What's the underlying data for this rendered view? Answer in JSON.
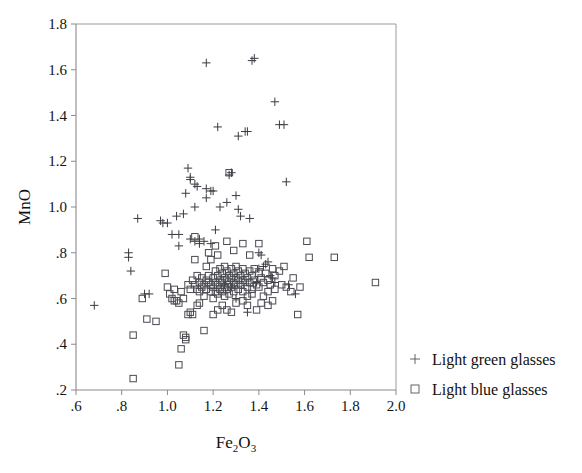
{
  "chart_data": {
    "type": "scatter",
    "title": "",
    "xlabel": "Fe2O3",
    "xlabel_display": "Fe",
    "xlabel_sub1": "2",
    "xlabel_mid": "O",
    "xlabel_sub2": "3",
    "ylabel": "MnO",
    "xlim": [
      0.6,
      2.0
    ],
    "ylim": [
      0.2,
      1.8
    ],
    "xticks": [
      0.6,
      0.8,
      1.0,
      1.2,
      1.4,
      1.6,
      1.8,
      2.0
    ],
    "xticklabels": [
      ".6",
      ".8",
      "1.0",
      "1.2",
      "1.4",
      "1.6",
      "1.8",
      "2.0"
    ],
    "yticks": [
      0.2,
      0.4,
      0.6,
      0.8,
      1.0,
      1.2,
      1.4,
      1.6,
      1.8
    ],
    "yticklabels": [
      ".2",
      ".4",
      ".6",
      ".8",
      "1.0",
      "1.2",
      "1.4",
      "1.6",
      "1.8"
    ],
    "grid": false,
    "legend_position": "outside-right-bottom",
    "series": [
      {
        "name": "Light green glasses",
        "marker": "plus",
        "color": "#3a3a42",
        "points": [
          [
            0.68,
            0.57
          ],
          [
            0.83,
            0.78
          ],
          [
            0.83,
            0.8
          ],
          [
            0.84,
            0.72
          ],
          [
            0.9,
            0.62
          ],
          [
            0.92,
            0.62
          ],
          [
            0.87,
            0.95
          ],
          [
            0.97,
            0.94
          ],
          [
            0.98,
            0.93
          ],
          [
            1.0,
            0.93
          ],
          [
            1.02,
            0.88
          ],
          [
            1.04,
            0.96
          ],
          [
            1.05,
            0.88
          ],
          [
            1.05,
            0.83
          ],
          [
            1.07,
            0.97
          ],
          [
            1.08,
            1.06
          ],
          [
            1.1,
            1.13
          ],
          [
            1.1,
            1.12
          ],
          [
            1.12,
            1.1
          ],
          [
            1.13,
            1.09
          ],
          [
            1.12,
            1.0
          ],
          [
            1.1,
            0.86
          ],
          [
            1.12,
            0.85
          ],
          [
            1.14,
            0.86
          ],
          [
            1.09,
            1.17
          ],
          [
            1.14,
            0.84
          ],
          [
            1.16,
            0.85
          ],
          [
            1.17,
            1.04
          ],
          [
            1.17,
            1.08
          ],
          [
            1.19,
            1.07
          ],
          [
            1.2,
            1.07
          ],
          [
            1.21,
            0.9
          ],
          [
            1.17,
            1.63
          ],
          [
            1.19,
            0.84
          ],
          [
            1.22,
            1.35
          ],
          [
            1.23,
            1.0
          ],
          [
            1.26,
            1.02
          ],
          [
            1.28,
            1.15
          ],
          [
            1.27,
            1.14
          ],
          [
            1.31,
            1.31
          ],
          [
            1.3,
            1.05
          ],
          [
            1.31,
            0.99
          ],
          [
            1.32,
            0.96
          ],
          [
            1.34,
            1.33
          ],
          [
            1.35,
            1.33
          ],
          [
            1.37,
            1.64
          ],
          [
            1.38,
            1.65
          ],
          [
            1.36,
            0.95
          ],
          [
            1.4,
            0.8
          ],
          [
            1.41,
            0.79
          ],
          [
            1.43,
            0.75
          ],
          [
            1.44,
            0.76
          ],
          [
            1.45,
            0.7
          ],
          [
            1.46,
            0.69
          ],
          [
            1.47,
            1.46
          ],
          [
            1.47,
            0.67
          ],
          [
            1.49,
            1.36
          ],
          [
            1.51,
            1.36
          ],
          [
            1.52,
            1.11
          ],
          [
            1.53,
            0.66
          ],
          [
            1.3,
            0.6
          ],
          [
            1.35,
            0.54
          ],
          [
            1.56,
            0.62
          ],
          [
            1.4,
            0.73
          ],
          [
            1.42,
            0.74
          ],
          [
            1.39,
            0.67
          ],
          [
            1.25,
            0.66
          ],
          [
            1.28,
            0.65
          ]
        ]
      },
      {
        "name": "Light blue glasses",
        "marker": "square",
        "color": "#4a4a52",
        "points": [
          [
            0.85,
            0.25
          ],
          [
            0.85,
            0.44
          ],
          [
            0.89,
            0.6
          ],
          [
            0.91,
            0.51
          ],
          [
            0.95,
            0.5
          ],
          [
            0.99,
            0.71
          ],
          [
            1.0,
            0.65
          ],
          [
            1.01,
            0.62
          ],
          [
            1.02,
            0.6
          ],
          [
            1.03,
            0.64
          ],
          [
            1.03,
            0.59
          ],
          [
            1.04,
            0.59
          ],
          [
            1.05,
            0.58
          ],
          [
            1.06,
            0.63
          ],
          [
            1.07,
            0.6
          ],
          [
            1.05,
            0.31
          ],
          [
            1.06,
            0.38
          ],
          [
            1.07,
            0.44
          ],
          [
            1.08,
            0.42
          ],
          [
            1.08,
            0.43
          ],
          [
            1.09,
            0.53
          ],
          [
            1.1,
            0.54
          ],
          [
            1.11,
            0.53
          ],
          [
            1.09,
            0.66
          ],
          [
            1.1,
            0.64
          ],
          [
            1.11,
            0.68
          ],
          [
            1.12,
            0.77
          ],
          [
            1.12,
            0.66
          ],
          [
            1.13,
            0.64
          ],
          [
            1.13,
            0.7
          ],
          [
            1.14,
            0.67
          ],
          [
            1.14,
            0.63
          ],
          [
            1.15,
            0.69
          ],
          [
            1.15,
            0.65
          ],
          [
            1.16,
            0.66
          ],
          [
            1.16,
            0.61
          ],
          [
            1.17,
            0.68
          ],
          [
            1.17,
            0.64
          ],
          [
            1.18,
            0.67
          ],
          [
            1.18,
            0.7
          ],
          [
            1.19,
            0.66
          ],
          [
            1.19,
            0.63
          ],
          [
            1.2,
            0.69
          ],
          [
            1.2,
            0.65
          ],
          [
            1.2,
            0.6
          ],
          [
            1.21,
            0.72
          ],
          [
            1.21,
            0.67
          ],
          [
            1.21,
            0.63
          ],
          [
            1.22,
            0.7
          ],
          [
            1.22,
            0.66
          ],
          [
            1.22,
            0.62
          ],
          [
            1.23,
            0.73
          ],
          [
            1.23,
            0.68
          ],
          [
            1.23,
            0.64
          ],
          [
            1.24,
            0.71
          ],
          [
            1.24,
            0.67
          ],
          [
            1.24,
            0.63
          ],
          [
            1.25,
            0.74
          ],
          [
            1.25,
            0.69
          ],
          [
            1.25,
            0.65
          ],
          [
            1.25,
            0.61
          ],
          [
            1.26,
            0.72
          ],
          [
            1.26,
            0.68
          ],
          [
            1.26,
            0.64
          ],
          [
            1.27,
            0.7
          ],
          [
            1.27,
            0.66
          ],
          [
            1.27,
            0.62
          ],
          [
            1.28,
            0.73
          ],
          [
            1.28,
            0.69
          ],
          [
            1.28,
            0.65
          ],
          [
            1.29,
            0.71
          ],
          [
            1.29,
            0.67
          ],
          [
            1.29,
            0.63
          ],
          [
            1.3,
            0.74
          ],
          [
            1.3,
            0.69
          ],
          [
            1.3,
            0.66
          ],
          [
            1.31,
            0.72
          ],
          [
            1.31,
            0.68
          ],
          [
            1.31,
            0.64
          ],
          [
            1.32,
            0.7
          ],
          [
            1.32,
            0.66
          ],
          [
            1.33,
            0.73
          ],
          [
            1.33,
            0.68
          ],
          [
            1.33,
            0.63
          ],
          [
            1.34,
            0.71
          ],
          [
            1.34,
            0.67
          ],
          [
            1.35,
            0.69
          ],
          [
            1.35,
            0.65
          ],
          [
            1.36,
            0.72
          ],
          [
            1.36,
            0.67
          ],
          [
            1.37,
            0.7
          ],
          [
            1.37,
            0.64
          ],
          [
            1.38,
            0.73
          ],
          [
            1.38,
            0.68
          ],
          [
            1.39,
            0.66
          ],
          [
            1.4,
            0.71
          ],
          [
            1.4,
            0.65
          ],
          [
            1.41,
            0.69
          ],
          [
            1.42,
            0.67
          ],
          [
            1.43,
            0.71
          ],
          [
            1.44,
            0.68
          ],
          [
            1.45,
            0.66
          ],
          [
            1.46,
            0.73
          ],
          [
            1.47,
            0.7
          ],
          [
            1.18,
            0.8
          ],
          [
            1.21,
            0.83
          ],
          [
            1.22,
            0.79
          ],
          [
            1.26,
            0.85
          ],
          [
            1.29,
            0.81
          ],
          [
            1.33,
            0.84
          ],
          [
            1.36,
            0.79
          ],
          [
            1.4,
            0.84
          ],
          [
            1.12,
            0.87
          ],
          [
            1.27,
            1.15
          ],
          [
            1.17,
            0.74
          ],
          [
            1.19,
            0.77
          ],
          [
            1.24,
            0.57
          ],
          [
            1.26,
            0.55
          ],
          [
            1.3,
            0.58
          ],
          [
            1.33,
            0.59
          ],
          [
            1.35,
            0.61
          ],
          [
            1.2,
            0.53
          ],
          [
            1.22,
            0.55
          ],
          [
            1.28,
            0.54
          ],
          [
            1.35,
            0.57
          ],
          [
            1.37,
            0.62
          ],
          [
            1.42,
            0.61
          ],
          [
            1.44,
            0.63
          ],
          [
            1.47,
            0.64
          ],
          [
            1.5,
            0.66
          ],
          [
            1.52,
            0.65
          ],
          [
            1.54,
            0.63
          ],
          [
            1.57,
            0.53
          ],
          [
            1.58,
            0.65
          ],
          [
            1.61,
            0.85
          ],
          [
            1.62,
            0.78
          ],
          [
            1.49,
            0.72
          ],
          [
            1.51,
            0.74
          ],
          [
            1.55,
            0.69
          ],
          [
            1.44,
            0.57
          ],
          [
            1.46,
            0.59
          ],
          [
            1.39,
            0.55
          ],
          [
            1.41,
            0.58
          ],
          [
            1.73,
            0.78
          ],
          [
            1.91,
            0.67
          ],
          [
            1.16,
            0.46
          ],
          [
            1.14,
            0.58
          ],
          [
            1.13,
            0.57
          ]
        ]
      }
    ]
  },
  "legend": {
    "entries": [
      {
        "label": "Light green glasses",
        "marker": "plus"
      },
      {
        "label": "Light blue glasses",
        "marker": "square"
      }
    ]
  }
}
